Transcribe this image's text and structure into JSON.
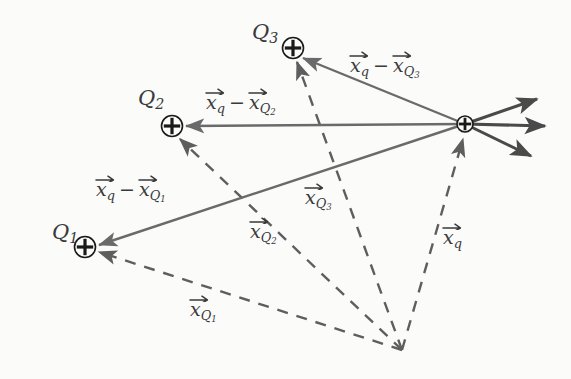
{
  "figure": {
    "type": "vector-diagram",
    "background_color": "#fbfbfa",
    "solid_vector_color": "#6a6a6a",
    "dashed_vector_color": "#5e5e5e",
    "force_arrow_color": "#4a4a4a",
    "label_color": "#3a3a3a",
    "marker_color": "#1a1a1a"
  },
  "charges": [
    {
      "id": "Q1",
      "label_base": "Q",
      "label_sub": "1",
      "marker": "circled-plus",
      "x": 85,
      "y": 247,
      "label_x": 52,
      "label_y": 222
    },
    {
      "id": "Q2",
      "label_base": "Q",
      "label_sub": "2",
      "marker": "circled-plus",
      "x": 172,
      "y": 126,
      "label_x": 138,
      "label_y": 88
    },
    {
      "id": "Q3",
      "label_base": "Q",
      "label_sub": "3",
      "marker": "circled-plus",
      "x": 293,
      "y": 48,
      "label_x": 252,
      "label_y": 22
    }
  ],
  "test_charge": {
    "id": "q",
    "marker": "circled-plus",
    "x": 465,
    "y": 124
  },
  "origin": {
    "x": 402,
    "y": 350
  },
  "separation_vectors": [
    {
      "id": "xq-minus-xQ1",
      "base": "x",
      "base_sub": "q",
      "operator": "−",
      "term_base": "x",
      "term_sub": "Q",
      "term_sub2": "1",
      "from_x": 465,
      "from_y": 124,
      "to_x": 99,
      "to_y": 245,
      "label_x": 96,
      "label_y": 180
    },
    {
      "id": "xq-minus-xQ2",
      "base": "x",
      "base_sub": "q",
      "operator": "−",
      "term_base": "x",
      "term_sub": "Q",
      "term_sub2": "2",
      "from_x": 465,
      "from_y": 124,
      "to_x": 186,
      "to_y": 126,
      "label_x": 206,
      "label_y": 93
    },
    {
      "id": "xq-minus-xQ3",
      "base": "x",
      "base_sub": "q",
      "operator": "−",
      "term_base": "x",
      "term_sub": "Q",
      "term_sub2": "3",
      "from_x": 465,
      "from_y": 124,
      "to_x": 303,
      "to_y": 58,
      "label_x": 350,
      "label_y": 56
    }
  ],
  "position_vectors": [
    {
      "id": "xQ1",
      "base": "x",
      "sub": "Q",
      "sub2": "1",
      "from_x": 402,
      "from_y": 350,
      "to_x": 99,
      "to_y": 252,
      "label_x": 190,
      "label_y": 300,
      "style": "dashed"
    },
    {
      "id": "xQ2",
      "base": "x",
      "sub": "Q",
      "sub2": "2",
      "from_x": 402,
      "from_y": 350,
      "to_x": 180,
      "to_y": 139,
      "label_x": 250,
      "label_y": 222,
      "style": "dashed"
    },
    {
      "id": "xQ3",
      "base": "x",
      "sub": "Q",
      "sub2": "3",
      "from_x": 402,
      "from_y": 350,
      "to_x": 297,
      "to_y": 62,
      "label_x": 305,
      "label_y": 188,
      "style": "dashed"
    },
    {
      "id": "xq",
      "base": "x",
      "sub": "q",
      "sub2": "",
      "from_x": 402,
      "from_y": 350,
      "to_x": 463,
      "to_y": 139,
      "label_x": 443,
      "label_y": 228,
      "style": "dashed"
    }
  ],
  "force_arrows": [
    {
      "id": "force-upper",
      "from_x": 465,
      "from_y": 124,
      "to_x": 537,
      "to_y": 99
    },
    {
      "id": "force-middle",
      "from_x": 465,
      "from_y": 124,
      "to_x": 545,
      "to_y": 126
    },
    {
      "id": "force-lower",
      "from_x": 465,
      "from_y": 124,
      "to_x": 531,
      "to_y": 156
    }
  ]
}
